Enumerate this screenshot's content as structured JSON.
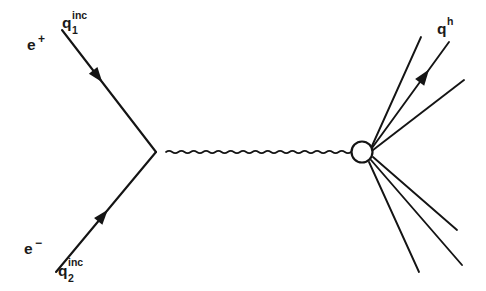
{
  "figure": {
    "type": "feynman-diagram",
    "background_color": "#ffffff",
    "ink_color": "#141414",
    "width": 486,
    "height": 291
  },
  "labels": {
    "positron": {
      "particle": "e",
      "charge": "+",
      "full": "e+"
    },
    "electron": {
      "particle": "e",
      "charge": "−",
      "full": "e−"
    },
    "incoming_quark_1": {
      "base": "q",
      "subscript": "1",
      "superscript": "inc",
      "full": "q1inc"
    },
    "incoming_quark_2": {
      "base": "q",
      "subscript": "2",
      "superscript": "inc",
      "full": "q2inc"
    },
    "outgoing_hadron": {
      "base": "q",
      "superscript": "h",
      "full": "qh"
    }
  },
  "elements": {
    "vertex": {
      "name": "annihilation-vertex",
      "x": 156,
      "y": 152
    },
    "blob": {
      "name": "hadronization-blob",
      "cx": 362,
      "cy": 152,
      "r": 10.5
    },
    "propagator": {
      "name": "virtual-photon-propagator",
      "style": "wavy",
      "x1": 166,
      "y1": 152,
      "x2": 351,
      "y2": 152,
      "amplitude": 2.3,
      "wavelength": 6.2
    },
    "incoming_lines": [
      {
        "name": "positron-line",
        "x1": 62,
        "y1": 30,
        "x2": 156,
        "y2": 152,
        "arrow_t": 0.38,
        "direction": "inward"
      },
      {
        "name": "electron-line",
        "x1": 56,
        "y1": 272,
        "x2": 156,
        "y2": 152,
        "arrow_t": 0.47,
        "direction": "inward"
      }
    ],
    "outgoing_lines": [
      {
        "name": "hadron-line-1",
        "x1": 372,
        "y1": 146,
        "x2": 421,
        "y2": 37,
        "arrow": false
      },
      {
        "name": "hadron-line-2",
        "x1": 372,
        "y1": 148,
        "x2": 449,
        "y2": 42,
        "arrow": true,
        "arrow_t": 0.68
      },
      {
        "name": "hadron-line-3",
        "x1": 373,
        "y1": 150,
        "x2": 464,
        "y2": 80,
        "arrow": false
      },
      {
        "name": "hadron-line-4",
        "x1": 373,
        "y1": 157,
        "x2": 457,
        "y2": 230,
        "arrow": false
      },
      {
        "name": "hadron-line-5",
        "x1": 371,
        "y1": 160,
        "x2": 462,
        "y2": 265,
        "arrow": false
      },
      {
        "name": "hadron-line-6",
        "x1": 369,
        "y1": 162,
        "x2": 419,
        "y2": 272,
        "arrow": false
      }
    ]
  }
}
